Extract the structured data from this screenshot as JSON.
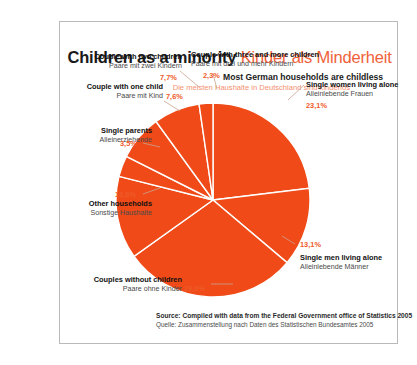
{
  "title": {
    "english": "Children as a minority",
    "german": "Kinder als Minderheit"
  },
  "subtitle": {
    "english": "Most German households are childless",
    "german": "Die meisten Haushalte in Deutschland sind kinderlos"
  },
  "source": {
    "english": "Source: Compiled with data from the Federal Government office of  Statistics 2005",
    "german": "Quelle: Zusammenstellung nach Daten des Statistischen Bundesamtes 2005"
  },
  "colors": {
    "slice": "#ef4a18",
    "accent": "#ef5a28",
    "title_accent": "#f0613a",
    "subtitle_accent": "#f5906f",
    "border": "#b9b9b9",
    "separator": "#ffffff",
    "leader": "#c8a08a"
  },
  "labels": {
    "couple_two_children": {
      "english": "Couple with two children",
      "german": "Paare mit zwei Kindern",
      "percent": "7,7%"
    },
    "couple_three_children": {
      "english": "Couple with three and more children",
      "german": "Paare mit drei und mehr Kindern",
      "percent": "2,3%"
    },
    "single_women": {
      "english": "Single women living alone",
      "german": "Alleinlebende Frauen",
      "percent": "23,1%"
    },
    "couple_one_child": {
      "english": "Couple with one child",
      "german": "Paare mit Kind",
      "percent": "7,6%"
    },
    "single_parents": {
      "english": "Single parents",
      "german": "Alleinerziehende",
      "percent": "3,5%"
    },
    "other_households": {
      "english": "Other households",
      "german": "Sonstige Haushalte",
      "percent": "13,8%"
    },
    "single_men": {
      "english": "Single men living alone",
      "german": "Alleinlebende Männer",
      "percent": "13,1%"
    },
    "couples_without_children": {
      "english": "Couples without children",
      "german": "Paare ohne Kinder",
      "percent": "29,0%"
    }
  },
  "chart_data": {
    "type": "pie",
    "subtitle": "Most German households are childless / Die meisten Haushalte in Deutschland sind kinderlos",
    "unit": "percent of households",
    "start_angle_deg": 0,
    "direction": "clockwise",
    "legend": "callout-labels",
    "grid": false,
    "categories": [
      "Single women living alone",
      "Single men living alone",
      "Couples without children",
      "Other households",
      "Single parents",
      "Couple with one child",
      "Couple with two children",
      "Couple with three and more children"
    ],
    "categories_de": [
      "Alleinlebende Frauen",
      "Alleinlebende Männer",
      "Paare ohne Kinder",
      "Sonstige Haushalte",
      "Alleinerziehende",
      "Paare mit Kind",
      "Paare mit zwei Kindern",
      "Paare mit drei und mehr Kindern"
    ],
    "values": [
      23.1,
      13.1,
      29.0,
      13.8,
      3.5,
      7.6,
      7.7,
      2.3
    ],
    "value_labels": [
      "23,1%",
      "13,1%",
      "29,0%",
      "13,8%",
      "3,5%",
      "7,6%",
      "7,7%",
      "2,3%"
    ],
    "total": 100.1,
    "slice_color": "#ef4a18"
  }
}
